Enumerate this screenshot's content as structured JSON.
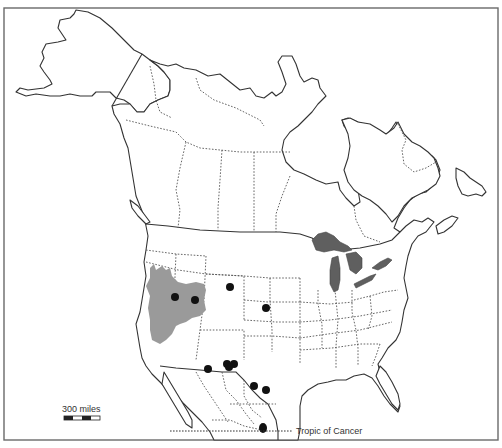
{
  "map": {
    "subject": "North America distribution map",
    "colors": {
      "range_fill": "#9a9a9a",
      "lakes_fill": "#5f5f5f",
      "point_color": "#111111",
      "outline": "#333333",
      "frame": "#6a6a6a"
    },
    "labels": {
      "tropic": "Tropic of Cancer",
      "scale": "300 miles"
    },
    "legend": {
      "scale_bar_label": "300 miles",
      "scale_bar_segments": 4
    },
    "range_areas": [
      {
        "name": "Great Basin range (Nevada / western Utah)",
        "shade": "gray"
      }
    ],
    "occurrence_points": [
      {
        "id": 1,
        "region": "Nevada",
        "x": 175,
        "y": 297
      },
      {
        "id": 2,
        "region": "Utah",
        "x": 195,
        "y": 300
      },
      {
        "id": 3,
        "region": "Wyoming",
        "x": 230,
        "y": 287
      },
      {
        "id": 4,
        "region": "Kansas",
        "x": 266,
        "y": 308
      },
      {
        "id": 5,
        "region": "New Mexico / Texas",
        "x": 208,
        "y": 369
      },
      {
        "id": 6,
        "region": "Texas (west)",
        "x": 227,
        "y": 364
      },
      {
        "id": 7,
        "region": "Texas (west)",
        "x": 234,
        "y": 364
      },
      {
        "id": 8,
        "region": "Texas (west)",
        "x": 229,
        "y": 366
      },
      {
        "id": 9,
        "region": "Texas / Coahuila",
        "x": 254,
        "y": 387
      },
      {
        "id": 10,
        "region": "Texas (south)",
        "x": 266,
        "y": 390
      },
      {
        "id": 11,
        "region": "Mexico (Tropic of Cancer)",
        "x": 263,
        "y": 428
      }
    ]
  }
}
